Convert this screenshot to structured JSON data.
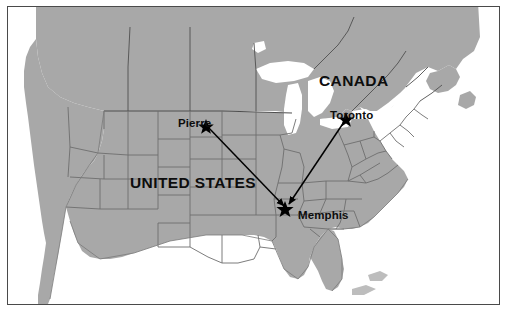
{
  "map": {
    "title": "North America route map",
    "frame": {
      "border_color": "#4a4a4a",
      "background": "#ffffff"
    },
    "colors": {
      "land": "#a8a8a8",
      "water": "#ffffff",
      "state_border": "#6e6e6e",
      "country_border": "#4f4f4f",
      "coastline": "#7a7a7a",
      "route_line": "#000000",
      "marker": "#000000",
      "label_text": "#0d0d0d"
    },
    "country_labels": [
      {
        "id": "canada",
        "text": "CANADA",
        "x": 311,
        "y": 66
      },
      {
        "id": "united-states",
        "text": "UNITED STATES",
        "x": 122,
        "y": 168
      }
    ],
    "cities": [
      {
        "id": "pierre",
        "name": "Pierre",
        "marker_x": 205,
        "marker_y": 124,
        "label_x": 170,
        "label_y": 111,
        "label_anchor": "left"
      },
      {
        "id": "toronto",
        "name": "Toronto",
        "marker_x": 345,
        "marker_y": 117,
        "label_x": 322,
        "label_y": 103,
        "label_anchor": "above"
      },
      {
        "id": "memphis",
        "name": "Memphis",
        "marker_x": 284,
        "marker_y": 207,
        "label_x": 290,
        "label_y": 203,
        "label_anchor": "right"
      }
    ],
    "routes": [
      {
        "id": "pierre-to-memphis",
        "from": "Pierre",
        "to": "Memphis",
        "from_x": 205,
        "from_y": 124,
        "to_x": 284,
        "to_y": 207,
        "arrow": "to"
      },
      {
        "id": "toronto-to-memphis",
        "from": "Toronto",
        "to": "Memphis",
        "from_x": 345,
        "from_y": 117,
        "to_x": 284,
        "to_y": 207,
        "arrow": "to"
      }
    ]
  }
}
